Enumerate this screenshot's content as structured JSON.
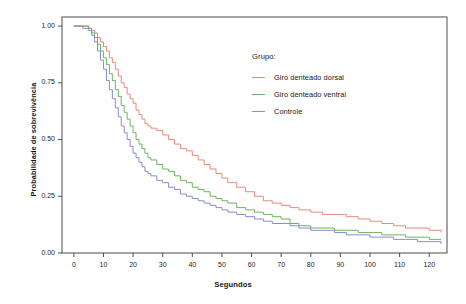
{
  "chart_data": {
    "type": "line",
    "title": "",
    "xlabel": "Segundos",
    "ylabel": "Probabilidade de sobrevivência",
    "xlim": [
      -4,
      126
    ],
    "ylim": [
      0.0,
      1.04
    ],
    "xticks": [
      "0",
      "10",
      "20",
      "30",
      "40",
      "50",
      "60",
      "70",
      "80",
      "90",
      "100",
      "110",
      "120"
    ],
    "xtick_values": [
      0,
      10,
      20,
      30,
      40,
      50,
      60,
      70,
      80,
      90,
      100,
      110,
      120
    ],
    "yticks": [
      "0.00",
      "0.25",
      "0.50",
      "0.75",
      "1.00"
    ],
    "ytick_values": [
      0.0,
      0.25,
      0.5,
      0.75,
      1.0
    ],
    "grid": false,
    "legend_position": "inside-right",
    "legend_title": "Grupo:",
    "step_style": "post",
    "series": [
      {
        "name": "Giro denteado dorsal",
        "color": "#e8897d",
        "x": [
          0,
          3,
          5,
          6,
          7,
          8,
          9,
          10,
          11,
          12,
          13,
          14,
          15,
          16,
          17,
          18,
          19,
          20,
          21,
          22,
          23,
          24,
          25,
          26,
          28,
          30,
          32,
          34,
          36,
          38,
          40,
          42,
          44,
          46,
          48,
          50,
          52,
          55,
          58,
          61,
          64,
          67,
          70,
          73,
          76,
          80,
          84,
          88,
          92,
          96,
          100,
          104,
          108,
          112,
          116,
          120,
          124
        ],
        "values": [
          1.0,
          1.0,
          0.99,
          0.98,
          0.97,
          0.95,
          0.93,
          0.91,
          0.89,
          0.86,
          0.84,
          0.81,
          0.78,
          0.75,
          0.73,
          0.7,
          0.68,
          0.66,
          0.63,
          0.61,
          0.59,
          0.57,
          0.56,
          0.55,
          0.54,
          0.52,
          0.5,
          0.48,
          0.46,
          0.45,
          0.43,
          0.41,
          0.39,
          0.37,
          0.35,
          0.33,
          0.31,
          0.29,
          0.27,
          0.25,
          0.23,
          0.22,
          0.21,
          0.2,
          0.19,
          0.18,
          0.17,
          0.17,
          0.16,
          0.15,
          0.14,
          0.13,
          0.12,
          0.11,
          0.11,
          0.1,
          0.09
        ]
      },
      {
        "name": "Giro denteado ventral",
        "color": "#6ab55f",
        "x": [
          0,
          3,
          5,
          6,
          7,
          8,
          9,
          10,
          11,
          12,
          13,
          14,
          15,
          16,
          17,
          18,
          19,
          20,
          21,
          22,
          23,
          24,
          25,
          26,
          28,
          30,
          32,
          34,
          36,
          38,
          40,
          42,
          44,
          46,
          48,
          50,
          52,
          55,
          58,
          61,
          64,
          67,
          70,
          73,
          76,
          80,
          84,
          88,
          92,
          96,
          100,
          104,
          108,
          112,
          116,
          120,
          124
        ],
        "values": [
          1.0,
          1.0,
          0.99,
          0.97,
          0.95,
          0.92,
          0.89,
          0.86,
          0.83,
          0.79,
          0.76,
          0.72,
          0.69,
          0.65,
          0.62,
          0.59,
          0.56,
          0.53,
          0.5,
          0.48,
          0.46,
          0.44,
          0.42,
          0.41,
          0.39,
          0.37,
          0.36,
          0.34,
          0.32,
          0.31,
          0.29,
          0.28,
          0.27,
          0.25,
          0.24,
          0.23,
          0.22,
          0.2,
          0.19,
          0.18,
          0.17,
          0.16,
          0.15,
          0.13,
          0.12,
          0.11,
          0.11,
          0.1,
          0.1,
          0.09,
          0.09,
          0.08,
          0.08,
          0.07,
          0.07,
          0.06,
          0.06
        ]
      },
      {
        "name": "Controle",
        "color": "#8b8bd0",
        "x": [
          0,
          3,
          5,
          6,
          7,
          8,
          9,
          10,
          11,
          12,
          13,
          14,
          15,
          16,
          17,
          18,
          19,
          20,
          21,
          22,
          23,
          24,
          25,
          26,
          28,
          30,
          32,
          34,
          36,
          38,
          40,
          42,
          44,
          46,
          48,
          50,
          52,
          55,
          58,
          61,
          64,
          67,
          70,
          73,
          76,
          80,
          84,
          88,
          92,
          96,
          100,
          104,
          108,
          112,
          116,
          120,
          124
        ],
        "values": [
          1.0,
          0.99,
          0.98,
          0.96,
          0.93,
          0.89,
          0.85,
          0.81,
          0.76,
          0.72,
          0.68,
          0.64,
          0.6,
          0.56,
          0.53,
          0.5,
          0.47,
          0.44,
          0.42,
          0.4,
          0.38,
          0.36,
          0.35,
          0.34,
          0.32,
          0.31,
          0.29,
          0.28,
          0.26,
          0.25,
          0.24,
          0.23,
          0.22,
          0.21,
          0.2,
          0.19,
          0.18,
          0.17,
          0.16,
          0.15,
          0.14,
          0.13,
          0.13,
          0.12,
          0.11,
          0.1,
          0.1,
          0.09,
          0.08,
          0.08,
          0.07,
          0.07,
          0.06,
          0.06,
          0.05,
          0.05,
          0.04
        ]
      }
    ]
  },
  "legend": {
    "title": "Grupo:",
    "items": [
      {
        "label": "Giro denteado dorsal",
        "color": "#e8897d"
      },
      {
        "label": "Giro denteado ventral",
        "color": "#6ab55f"
      },
      {
        "label": "Controle",
        "color": "#8b8bd0"
      }
    ]
  },
  "axes": {
    "x_label": "Segundos",
    "y_label": "Probabilidade de sobrevivência"
  },
  "style": {
    "frame_color": "#4d4d4d",
    "background": "#ffffff"
  }
}
